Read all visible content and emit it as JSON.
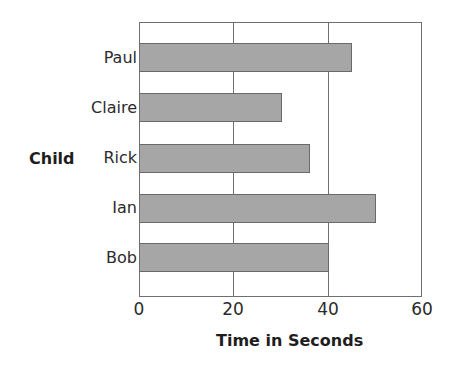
{
  "chart_data": {
    "type": "bar",
    "orientation": "horizontal",
    "title": "",
    "categories": [
      "Paul",
      "Claire",
      "Rick",
      "Ian",
      "Bob"
    ],
    "values": [
      45,
      30,
      36,
      50,
      40
    ],
    "xlabel": "Time in Seconds",
    "ylabel": "Child",
    "xlim": [
      0,
      60
    ],
    "xticks": [
      "0",
      "20",
      "40",
      "60"
    ],
    "grid": true,
    "legend": null,
    "bar_color": "#a6a6a6"
  }
}
